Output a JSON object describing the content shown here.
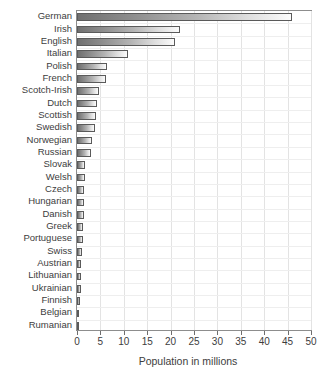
{
  "chart_data": {
    "type": "bar",
    "orientation": "horizontal",
    "title": "",
    "subtitle": "",
    "xlabel": "Population in millions",
    "ylabel": "",
    "xlim": [
      0,
      50
    ],
    "xticks": [
      0,
      5,
      10,
      15,
      20,
      25,
      30,
      35,
      40,
      45,
      50
    ],
    "grid": true,
    "legend": false,
    "categories": [
      "German",
      "Irish",
      "English",
      "Italian",
      "Polish",
      "French",
      "Scotch-Irish",
      "Dutch",
      "Scottish",
      "Swedish",
      "Norwegian",
      "Russian",
      "Slovak",
      "Welsh",
      "Czech",
      "Hungarian",
      "Danish",
      "Greek",
      "Portuguese",
      "Swiss",
      "Austrian",
      "Lithuanian",
      "Ukrainian",
      "Finnish",
      "Belgian",
      "Rumanian"
    ],
    "values": [
      46.0,
      22.0,
      21.0,
      11.0,
      6.5,
      6.2,
      4.7,
      4.2,
      4.0,
      3.8,
      3.3,
      2.9,
      1.8,
      1.7,
      1.6,
      1.5,
      1.4,
      1.3,
      1.2,
      1.0,
      0.9,
      0.8,
      0.8,
      0.7,
      0.4,
      0.2
    ]
  },
  "style": {
    "bar_border_color": "#5a5a5a",
    "bar_gradient_start": "#707070",
    "bar_gradient_end": "#fbfbfb",
    "grid_color": "#e3e3e3",
    "frame_color": "#8d8d8d",
    "text_color": "#3d3d3d"
  }
}
